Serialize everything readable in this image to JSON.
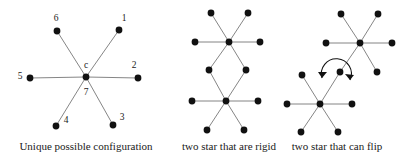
{
  "figure": {
    "background_color": "#ffffff",
    "edge_color": "#777777",
    "node_color": "#111111",
    "label_color": "#1a1a1a",
    "node_radius": 3.4,
    "edge_width": 0.9,
    "panels": [
      {
        "id": "panel-unique-configuration",
        "caption": "Unique possible configuration",
        "caption_x": 86,
        "caption_y": 150,
        "stars": [
          {
            "id": "star-center-c",
            "center": {
              "x": 86,
              "y": 77,
              "labels": [
                {
                  "text": "c",
                  "x": 86,
                  "y": 68
                },
                {
                  "text": "7",
                  "x": 86,
                  "y": 95
                }
              ]
            },
            "spokes": [
              {
                "id": "spoke-1",
                "x": 119,
                "y": 30,
                "label": "1",
                "lx": 124,
                "ly": 21
              },
              {
                "id": "spoke-2",
                "x": 138,
                "y": 78,
                "label": "2",
                "lx": 134,
                "ly": 68
              },
              {
                "id": "spoke-3",
                "x": 113,
                "y": 125,
                "label": "3",
                "lx": 122,
                "ly": 120
              },
              {
                "id": "spoke-4",
                "x": 56,
                "y": 126,
                "label": "4",
                "lx": 66,
                "ly": 123
              },
              {
                "id": "spoke-5",
                "x": 30,
                "y": 78,
                "label": "5",
                "lx": 20,
                "ly": 79
              },
              {
                "id": "spoke-6",
                "x": 57,
                "y": 31,
                "label": "6",
                "lx": 56,
                "ly": 21
              }
            ]
          }
        ]
      },
      {
        "id": "panel-two-star-rigid",
        "caption": "two star that are rigid",
        "caption_x": 229,
        "caption_y": 150,
        "stars": [
          {
            "id": "star-top-rigid",
            "center": {
              "x": 229,
              "y": 42,
              "labels": []
            },
            "spokes": [
              {
                "id": "spoke-nw",
                "x": 211,
                "y": 13
              },
              {
                "id": "spoke-ne",
                "x": 248,
                "y": 13
              },
              {
                "id": "spoke-w",
                "x": 195,
                "y": 42
              },
              {
                "id": "spoke-e",
                "x": 260,
                "y": 42
              },
              {
                "id": "spoke-sw",
                "x": 209,
                "y": 70
              },
              {
                "id": "spoke-se",
                "x": 246,
                "y": 70
              }
            ]
          },
          {
            "id": "star-bottom-rigid",
            "center": {
              "x": 226,
              "y": 101,
              "labels": []
            },
            "spokes": [
              {
                "id": "spoke-nw",
                "x": 209,
                "y": 70
              },
              {
                "id": "spoke-ne",
                "x": 246,
                "y": 70
              },
              {
                "id": "spoke-w",
                "x": 192,
                "y": 101
              },
              {
                "id": "spoke-e",
                "x": 258,
                "y": 101
              },
              {
                "id": "spoke-sw",
                "x": 207,
                "y": 130
              },
              {
                "id": "spoke-se",
                "x": 244,
                "y": 130
              }
            ]
          }
        ]
      },
      {
        "id": "panel-two-star-flip",
        "caption": "two star that can flip",
        "caption_x": 337,
        "caption_y": 150,
        "stars": [
          {
            "id": "star-upper-right-flip",
            "center": {
              "x": 360,
              "y": 43,
              "labels": []
            },
            "spokes": [
              {
                "id": "spoke-nw",
                "x": 341,
                "y": 14
              },
              {
                "id": "spoke-ne",
                "x": 378,
                "y": 14
              },
              {
                "id": "spoke-w",
                "x": 326,
                "y": 43
              },
              {
                "id": "spoke-e",
                "x": 392,
                "y": 43
              },
              {
                "id": "spoke-sw",
                "x": 340,
                "y": 72
              },
              {
                "id": "spoke-se",
                "x": 377,
                "y": 72
              }
            ]
          },
          {
            "id": "star-lower-left-flip",
            "center": {
              "x": 320,
              "y": 104,
              "labels": []
            },
            "spokes": [
              {
                "id": "spoke-nw",
                "x": 302,
                "y": 75
              },
              {
                "id": "spoke-ne",
                "x": 340,
                "y": 72
              },
              {
                "id": "spoke-w",
                "x": 287,
                "y": 104
              },
              {
                "id": "spoke-e",
                "x": 352,
                "y": 104
              },
              {
                "id": "spoke-sw",
                "x": 301,
                "y": 132
              },
              {
                "id": "spoke-se",
                "x": 338,
                "y": 132
              }
            ]
          }
        ],
        "flip_arrow": {
          "id": "flip-arrow",
          "path": "M 322 78 A 15 15 0 1 1 350 80",
          "arrowhead_start": "M 322 78 L 318 72 L 327 72 Z",
          "arrowhead_end": "M 350 80 L 345 74 L 354 75 Z"
        }
      }
    ]
  }
}
